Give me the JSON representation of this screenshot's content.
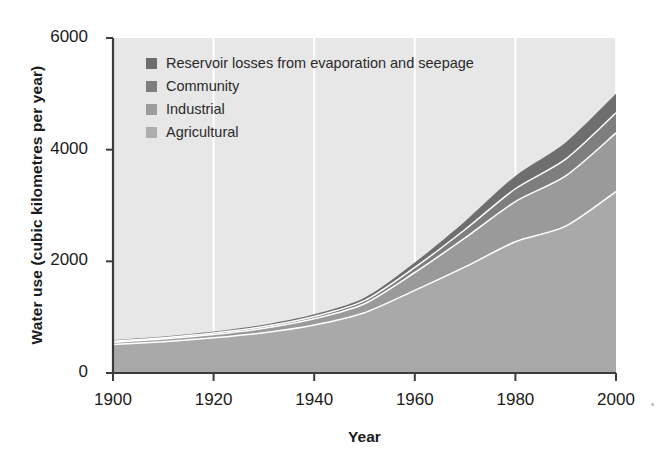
{
  "chart_data": {
    "type": "area",
    "title": "",
    "subtitle": "",
    "xlabel": "Year",
    "ylabel": "Water use (cubic kilometres per year)",
    "xlim": [
      1900,
      2000
    ],
    "ylim": [
      0,
      6000
    ],
    "xticks": [
      1900,
      1920,
      1940,
      1960,
      1980,
      2000
    ],
    "yticks": [
      0,
      2000,
      4000,
      6000
    ],
    "xtick_labels": [
      "1900",
      "1920",
      "1940",
      "1960",
      "1980",
      "2000"
    ],
    "ytick_labels": [
      "0",
      "2000",
      "4000",
      "6000"
    ],
    "grid": "vertical-white-gridlines",
    "stacked": true,
    "legend_position": "upper-left-inside",
    "plot_background": "#e7e7e7",
    "x": [
      1900,
      1910,
      1920,
      1930,
      1940,
      1950,
      1960,
      1970,
      1980,
      1990,
      2000
    ],
    "series": [
      {
        "name": "Agricultural",
        "color": "#a9a9a9",
        "values": [
          510,
          560,
          630,
          720,
          860,
          1080,
          1480,
          1900,
          2350,
          2630,
          3250
        ]
      },
      {
        "name": "Industrial",
        "color": "#9a9a9a",
        "values": [
          40,
          50,
          60,
          80,
          110,
          160,
          320,
          520,
          720,
          900,
          1050
        ]
      },
      {
        "name": "Community",
        "color": "#7e7e7e",
        "values": [
          20,
          22,
          26,
          32,
          42,
          55,
          90,
          150,
          230,
          300,
          360
        ]
      },
      {
        "name": "Reservoir losses from evaporation and seepage",
        "color": "#6e6e6e",
        "values": [
          20,
          22,
          26,
          32,
          40,
          55,
          90,
          150,
          230,
          300,
          340
        ]
      }
    ],
    "totals": [
      590,
      654,
      742,
      864,
      1052,
      1350,
      1980,
      2720,
      3530,
      4130,
      5000
    ],
    "legend": [
      {
        "label": "Reservoir losses from evaporation and seepage",
        "color": "#6e6e6e"
      },
      {
        "label": "Community",
        "color": "#7e7e7e"
      },
      {
        "label": "Industrial",
        "color": "#9c9c9c"
      },
      {
        "label": "Agricultural",
        "color": "#aeaeae"
      }
    ]
  },
  "axes": {
    "x_label": "Year",
    "y_label": "Water use (cubic kilometres per year)"
  }
}
